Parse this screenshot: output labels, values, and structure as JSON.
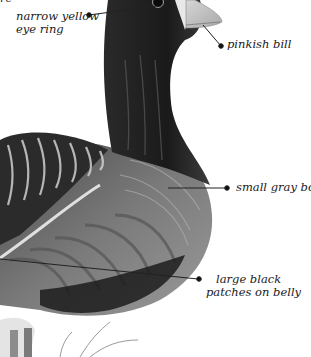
{
  "figure": {
    "top_fragment": "re",
    "annotations": [
      {
        "id": "eye-ring",
        "lines": [
          "narrow yellow",
          "eye ring"
        ]
      },
      {
        "id": "bill",
        "lines": [
          "pinkish bill"
        ]
      },
      {
        "id": "body",
        "lines": [
          "small gray body"
        ]
      },
      {
        "id": "belly",
        "lines": [
          "large black",
          "patches on belly"
        ]
      }
    ]
  },
  "colors": {
    "background": "#ffffff",
    "head": "#141414",
    "neck": "#3a3a3a",
    "body": "#8a8a8a",
    "bill": "#c9c9c9",
    "leader": "#222222"
  }
}
